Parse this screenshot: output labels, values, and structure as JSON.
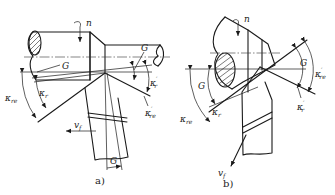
{
  "figure": {
    "type": "technical-drawing",
    "panels": [
      {
        "id": "a",
        "caption": "a)",
        "labels": {
          "rotation": "n",
          "feed_velocity": "v",
          "feed_velocity_sub": "f",
          "g_upper": "G",
          "g_right": "G",
          "g_bottom": "G",
          "kappa_re": "κ",
          "kappa_re_sub": "re",
          "kappa_r": "κ",
          "kappa_r_sub": "r",
          "kappa_r_prime": "κ",
          "kappa_r_prime_sub": "r",
          "kappa_r_prime_mark": "′",
          "kappa_re_prime": "κ",
          "kappa_re_prime_sub": "re",
          "kappa_re_prime_mark": "′"
        }
      },
      {
        "id": "b",
        "caption": "b)",
        "labels": {
          "rotation": "n",
          "feed_velocity": "v",
          "feed_velocity_sub": "f",
          "g_left": "G",
          "g_right": "G",
          "kappa_re": "κ",
          "kappa_re_sub": "re",
          "kappa_r": "κ",
          "kappa_r_sub": "r",
          "kappa_r_prime": "κ",
          "kappa_r_prime_sub": "r",
          "kappa_r_prime_mark": "′",
          "kappa_re_prime": "κ",
          "kappa_re_prime_sub": "re",
          "kappa_re_prime_mark": "′"
        }
      }
    ]
  }
}
